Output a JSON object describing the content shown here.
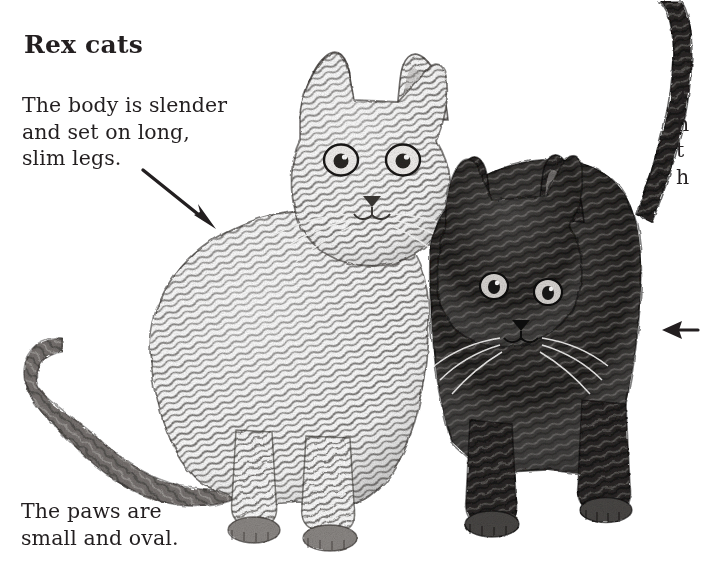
{
  "page": {
    "background_color": "#ffffff",
    "ink_color": "#231f20"
  },
  "title": "Rex cats",
  "captions": {
    "body": {
      "lines": [
        "The body is slender",
        "and set on long,",
        "slim legs."
      ]
    },
    "paws": {
      "lines": [
        "The paws are",
        "small and oval."
      ]
    },
    "right_cropped": {
      "lines": [
        "T",
        "h",
        "t",
        "h"
      ]
    }
  },
  "arrows": [
    {
      "name": "arrow-to-body",
      "direction": "down-right",
      "from": [
        145,
        172
      ],
      "to": [
        216,
        229
      ]
    },
    {
      "name": "arrow-to-right-cat",
      "direction": "left",
      "from": [
        695,
        330
      ],
      "to": [
        666,
        330
      ]
    }
  ],
  "illustration": {
    "name": "two-rex-cats-pencil-drawing",
    "medium": "pencil sketch",
    "subjects": [
      {
        "name": "left-cat",
        "coat": "light wavy rex coat",
        "pose": "standing facing viewer"
      },
      {
        "name": "right-cat",
        "coat": "dark wavy rex coat",
        "pose": "standing, tail raised"
      }
    ]
  }
}
